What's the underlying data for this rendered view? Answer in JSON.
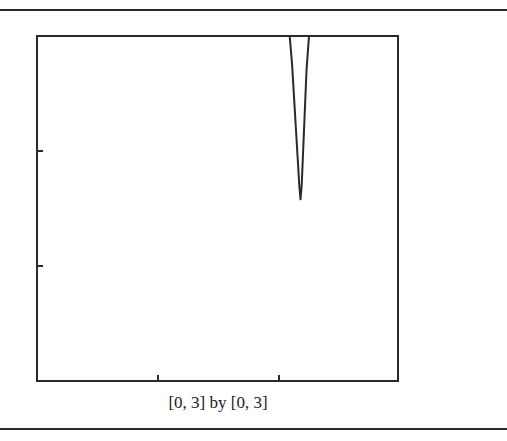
{
  "caption": "[0, 3] by [0, 3]",
  "colors": {
    "line": "#2a2a2a",
    "background": "#ffffff"
  },
  "chart_data": {
    "type": "line",
    "title": "",
    "xlabel": "",
    "ylabel": "",
    "xlim": [
      0,
      3
    ],
    "ylim": [
      0,
      3
    ],
    "xticks": [
      1,
      2
    ],
    "yticks": [
      1,
      2
    ],
    "grid": false,
    "legend": null,
    "window_caption": "[0, 3] by [0, 3]",
    "series": [
      {
        "name": "curve",
        "description": "Narrow downward spike from top of window converging to a minimum near x≈2.19, y≈1.58",
        "x": [
          2.1,
          2.12,
          2.14,
          2.16,
          2.18,
          2.19,
          2.2,
          2.22,
          2.24,
          2.26
        ],
        "y": [
          3.0,
          2.75,
          2.4,
          2.05,
          1.7,
          1.58,
          1.7,
          2.2,
          2.7,
          3.0
        ]
      }
    ]
  }
}
